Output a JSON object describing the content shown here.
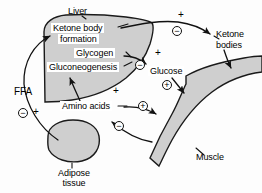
{
  "figure": {
    "type": "biochemical-pathway-diagram",
    "background_color": "#fdfdfd",
    "organ_fill_color": "#cfcfcf",
    "line_color": "#111111"
  },
  "organs": {
    "liver": {
      "label": "Liver"
    },
    "muscle": {
      "label": "Muscle"
    },
    "adipose": {
      "label_line1": "Adipose",
      "label_line2": "tissue"
    }
  },
  "processes": {
    "ketone_body_formation_line1": "Ketone body",
    "ketone_body_formation_line2": "formation",
    "glycogen": "Glycogen",
    "gluconeogenesis": "Gluconeogenesis"
  },
  "metabolites": {
    "ffa": "FFA",
    "glucose": "Glucose",
    "amino_acids": "Amino acids",
    "ketone_bodies_line1": "Ketone",
    "ketone_bodies_line2": "bodies"
  },
  "signs": {
    "plus_plain": "+",
    "plus_circled": "+",
    "minus_circled": "−",
    "items": [
      {
        "id": "sign-plus-ketone-out",
        "symbol": "+",
        "circled": false
      },
      {
        "id": "sign-minus-ketone-out",
        "symbol": "−",
        "circled": true
      },
      {
        "id": "sign-plus-glucose-out",
        "symbol": "+",
        "circled": false
      },
      {
        "id": "sign-minus-glucose-out",
        "symbol": "−",
        "circled": true
      },
      {
        "id": "sign-plus-glucose-muscle",
        "symbol": "+",
        "circled": true
      },
      {
        "id": "sign-plus-amino-acids",
        "symbol": "+",
        "circled": false
      },
      {
        "id": "sign-plus-amino-muscle",
        "symbol": "+",
        "circled": true
      },
      {
        "id": "sign-minus-muscle-amino",
        "symbol": "−",
        "circled": true
      },
      {
        "id": "sign-minus-adipose",
        "symbol": "−",
        "circled": true
      },
      {
        "id": "sign-plus-adipose",
        "symbol": "+",
        "circled": false
      }
    ]
  }
}
